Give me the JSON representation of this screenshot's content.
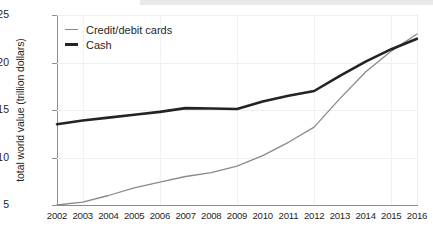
{
  "chart_data": {
    "type": "line",
    "title": "",
    "xlabel": "",
    "ylabel": "total world value (trillion dollars)",
    "x": [
      2002,
      2003,
      2004,
      2005,
      2006,
      2007,
      2008,
      2009,
      2010,
      2011,
      2012,
      2013,
      2014,
      2015,
      2016
    ],
    "categories": [
      "2002",
      "2003",
      "2004",
      "2005",
      "2006",
      "2007",
      "2008",
      "2009",
      "2010",
      "2011",
      "2012",
      "2013",
      "2014",
      "2015",
      "2016"
    ],
    "xlim": [
      2002,
      2016
    ],
    "ylim": [
      5,
      25
    ],
    "yticks": [
      5,
      10,
      15,
      20,
      25
    ],
    "ytick_labels": [
      "5",
      "10",
      "15",
      "20",
      "25"
    ],
    "grid": true,
    "legend_position": "upper-left",
    "series": [
      {
        "name": "Credit/debit cards",
        "color": "#8a8a8a",
        "width": 1.3,
        "values": [
          5.0,
          5.3,
          6.0,
          6.8,
          7.4,
          8.0,
          8.4,
          9.1,
          10.2,
          11.6,
          13.2,
          16.2,
          19.0,
          21.2,
          23.0
        ]
      },
      {
        "name": "Cash",
        "color": "#232323",
        "width": 2.6,
        "values": [
          13.5,
          13.9,
          14.2,
          14.5,
          14.8,
          15.2,
          15.15,
          15.1,
          15.9,
          16.5,
          17.0,
          18.6,
          20.1,
          21.4,
          22.5
        ]
      }
    ]
  },
  "legend": {
    "items": [
      {
        "label": "Credit/debit cards"
      },
      {
        "label": "Cash"
      }
    ]
  }
}
